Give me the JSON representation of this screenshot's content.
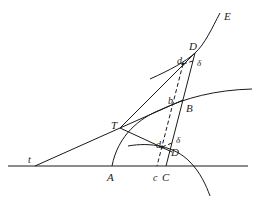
{
  "figure": {
    "type": "geometric-construction",
    "labels": {
      "E": "E",
      "D_upper": "D",
      "d_upper": "d",
      "delta_upper": "δ",
      "b": "b",
      "B": "B",
      "T": "T",
      "t": "t",
      "d_lower": "d",
      "delta_lower": "δ",
      "D_lower": "D",
      "A": "A",
      "c": "c",
      "C": "C"
    },
    "colors": {
      "line": "#1a1a1a",
      "background": "#ffffff"
    }
  }
}
